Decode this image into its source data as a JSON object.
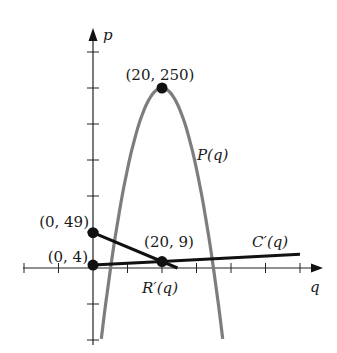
{
  "chart_data": {
    "type": "line",
    "title": "",
    "xlabel": "q",
    "ylabel": "p",
    "xlim": [
      -20,
      65
    ],
    "ylim": [
      -100,
      320
    ],
    "x_tick_step": 10,
    "y_tick_step": 50,
    "x_ticks": [
      -20,
      -10,
      10,
      20,
      30,
      40,
      50,
      60
    ],
    "y_ticks": [
      -100,
      -50,
      50,
      100,
      150,
      200,
      250,
      300
    ],
    "tick_labels_shown": false,
    "grid": false,
    "legend": "none (curves labeled directly)",
    "series": [
      {
        "name": "P(q)",
        "label": "P(q)",
        "kind": "parabola",
        "formula": "P(q) = -1.125q^2 + 45q - 200",
        "color": "#7a7a7a",
        "x": [
          2.4,
          5,
          10,
          15,
          20,
          25,
          30,
          35,
          37.6
        ],
        "values": [
          -100,
          0,
          137.5,
          221.9,
          250,
          221.9,
          137.5,
          0,
          -100
        ]
      },
      {
        "name": "R'(q)",
        "label": "R'(q)",
        "kind": "line",
        "formula": "R'(q) = 49 - 2q",
        "color": "#111111",
        "x": [
          0,
          20,
          24.5
        ],
        "values": [
          49,
          9,
          0
        ]
      },
      {
        "name": "C'(q)",
        "label": "C'(q)",
        "kind": "line",
        "formula": "C'(q) = 4 + q/4",
        "color": "#111111",
        "x": [
          0,
          20,
          60
        ],
        "values": [
          4,
          9,
          19
        ]
      }
    ],
    "annotations": [
      {
        "text": "(20, 250)",
        "x": 20,
        "y": 250,
        "marker": "dot"
      },
      {
        "text": "(0, 49)",
        "x": 0,
        "y": 49,
        "marker": "dot"
      },
      {
        "text": "(0, 4)",
        "x": 0,
        "y": 4,
        "marker": "dot"
      },
      {
        "text": "(20, 9)",
        "x": 20,
        "y": 9,
        "marker": "dot"
      }
    ]
  },
  "labels": {
    "y_axis": "p",
    "x_axis": "q",
    "P": "P(q)",
    "Rp": "R′(q)",
    "Cp": "C′(q)",
    "vertex": "(20, 250)",
    "r_intercept": "(0, 49)",
    "c_intercept": "(0, 4)",
    "intersection": "(20, 9)"
  }
}
